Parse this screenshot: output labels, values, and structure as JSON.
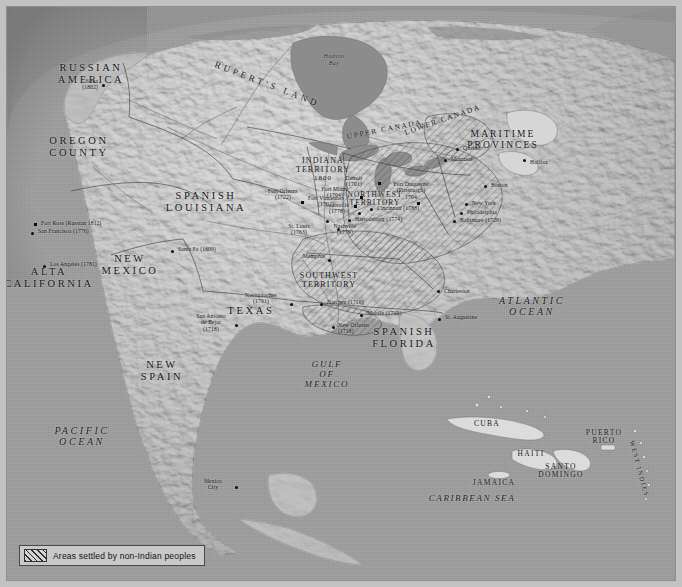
{
  "figure": {
    "kind": "historical-map",
    "title_visible": false
  },
  "colors": {
    "ocean": "#9c9c9c",
    "land": "#d8d8d8",
    "land_shadow": "#a9a9a9",
    "water_inland": "#8f8f8f",
    "text": "#161616",
    "frame": "#8e8e8e",
    "paper_margin": "#c2c2c2",
    "legend_bg": "#c9c9c9",
    "hatch": "#2e2e2e"
  },
  "legend": {
    "swatch_name": "diagonal-hatch-swatch",
    "label": "Areas settled by non-Indian peoples"
  },
  "oceans": [
    {
      "name": "pacific-ocean",
      "lines": [
        "PACIFIC",
        "OCEAN"
      ],
      "x": 42,
      "y": 424
    },
    {
      "name": "atlantic-ocean",
      "lines": [
        "ATLANTIC",
        "OCEAN"
      ],
      "x": 515,
      "y": 294
    },
    {
      "name": "gulf-of-mexico",
      "lines": [
        "GULF",
        "OF",
        "MEXICO"
      ],
      "x": 315,
      "y": 358
    },
    {
      "name": "caribbean-sea",
      "lines": [
        "CARIBBEAN SEA"
      ],
      "x": 463,
      "y": 491
    }
  ],
  "water_bodies": [
    {
      "name": "hudson-bay",
      "lines": [
        "Hudson",
        "Bay"
      ],
      "x": 325,
      "y": 52
    }
  ],
  "regions": [
    {
      "name": "russian-america",
      "lines": [
        "RUSSIAN",
        "AMERICA"
      ],
      "x": 81,
      "y": 61,
      "size": "big"
    },
    {
      "name": "oregon-county",
      "lines": [
        "OREGON",
        "COUNTY"
      ],
      "x": 68,
      "y": 134,
      "size": "big"
    },
    {
      "name": "alta-california",
      "lines": [
        "ALTA",
        "CALIFORNIA"
      ],
      "x": 22,
      "y": 265,
      "size": "big"
    },
    {
      "name": "new-mexico",
      "lines": [
        "NEW",
        "MEXICO"
      ],
      "x": 120,
      "y": 252,
      "size": "big"
    },
    {
      "name": "new-spain",
      "lines": [
        "NEW",
        "SPAIN"
      ],
      "x": 150,
      "y": 358,
      "size": "big"
    },
    {
      "name": "texas",
      "lines": [
        "TEXAS"
      ],
      "x": 243,
      "y": 304,
      "size": "big"
    },
    {
      "name": "spanish-louisiana",
      "lines": [
        "SPANISH",
        "LOUISIANA"
      ],
      "x": 196,
      "y": 189,
      "size": "big"
    },
    {
      "name": "spanish-florida",
      "lines": [
        "SPANISH",
        "FLORIDA"
      ],
      "x": 395,
      "y": 325,
      "size": "big"
    },
    {
      "name": "maritime-provinces",
      "lines": [
        "MARITIME",
        "PROVINCES"
      ],
      "x": 494,
      "y": 128,
      "size": "norm"
    },
    {
      "name": "ruperts-land",
      "lines": [
        "RUPERT'S LAND"
      ],
      "x": 228,
      "y": 62,
      "size": "arc"
    },
    {
      "name": "upper-canada",
      "lines": [
        "UPPER CANADA"
      ],
      "x": 355,
      "y": 129,
      "size": "arc"
    },
    {
      "name": "lower-canada",
      "lines": [
        "LOWER CANADA"
      ],
      "x": 414,
      "y": 121,
      "size": "arc"
    }
  ],
  "territories": [
    {
      "name": "indiana-territory",
      "lines": [
        "INDIANA",
        "TERRITORY",
        "1800"
      ],
      "x": 316,
      "y": 157
    },
    {
      "name": "northwest-territory",
      "lines": [
        "NORTHWEST",
        "TERRITORY"
      ],
      "x": 368,
      "y": 190
    },
    {
      "name": "southwest-territory",
      "lines": [
        "SOUTHWEST",
        "TERRITORY"
      ],
      "x": 320,
      "y": 271
    }
  ],
  "islands": [
    {
      "name": "cuba",
      "label": "CUBA",
      "x": 480,
      "y": 418
    },
    {
      "name": "haiti",
      "label": "HAITI",
      "x": 524,
      "y": 448
    },
    {
      "name": "santo-domingo",
      "lines": [
        "SANTO",
        "DOMINGO"
      ],
      "x": 553,
      "y": 461
    },
    {
      "name": "jamaica",
      "label": "JAMAICA",
      "x": 487,
      "y": 477
    },
    {
      "name": "puerto-rico",
      "lines": [
        "PUERTO",
        "RICO"
      ],
      "x": 596,
      "y": 428
    },
    {
      "name": "west-indies",
      "label": "WEST INDIES",
      "x": 637,
      "y": 445
    }
  ],
  "cities": [
    {
      "name": "sitka",
      "lines": [
        "Sitka",
        "(1802)"
      ],
      "x": 73,
      "y": 74,
      "dot": [
        95,
        77
      ],
      "align": "r",
      "marker": "dot"
    },
    {
      "name": "fort-ross",
      "lines": [
        "Fort Ross (Russian 1812)"
      ],
      "x": 34,
      "y": 216,
      "dot": [
        28,
        217
      ],
      "align": "l",
      "marker": "sq"
    },
    {
      "name": "san-francisco",
      "lines": [
        "San Francisco (1776)"
      ],
      "x": 30,
      "y": 224,
      "dot": [
        24,
        226
      ],
      "align": "l",
      "marker": "dot"
    },
    {
      "name": "los-angeles",
      "lines": [
        "Los Angeles (1781)"
      ],
      "x": 42,
      "y": 258,
      "dot": [
        36,
        259
      ],
      "align": "l",
      "marker": "dot"
    },
    {
      "name": "santa-fe",
      "lines": [
        "Santa Fe (1609)"
      ],
      "x": 170,
      "y": 243,
      "dot": [
        164,
        244
      ],
      "align": "l",
      "marker": "dot"
    },
    {
      "name": "san-antonio-de-bejar",
      "lines": [
        "San Antonio",
        "de Bejar",
        "(1718)"
      ],
      "x": 192,
      "y": 310,
      "dot": [
        228,
        318
      ],
      "align": "c",
      "marker": "dot"
    },
    {
      "name": "nacogdoches",
      "lines": [
        "Nacogdoches",
        "(1791)"
      ],
      "x": 241,
      "y": 288,
      "dot": [
        283,
        297
      ],
      "align": "c",
      "marker": "dot"
    },
    {
      "name": "new-orleans",
      "lines": [
        "New Orleans",
        "(1718)"
      ],
      "x": 330,
      "y": 319,
      "dot": [
        330,
        320
      ],
      "align": "l",
      "marker": "dot"
    },
    {
      "name": "natchez",
      "lines": [
        "Natchez (1716)"
      ],
      "x": 319,
      "y": 296,
      "dot": [
        314,
        297
      ],
      "align": "l",
      "marker": "dot"
    },
    {
      "name": "mobile",
      "lines": [
        "Mobile (1710)"
      ],
      "x": 359,
      "y": 307,
      "dot": [
        354,
        308
      ],
      "align": "l",
      "marker": "dot"
    },
    {
      "name": "st-augustine",
      "lines": [
        "St. Augustine"
      ],
      "x": 437,
      "y": 311,
      "dot": [
        432,
        312
      ],
      "align": "l",
      "marker": "dot"
    },
    {
      "name": "charleston",
      "lines": [
        "Charleston"
      ],
      "x": 436,
      "y": 286,
      "dot": [
        431,
        283
      ],
      "align": "l",
      "marker": "dot"
    },
    {
      "name": "memphis",
      "lines": [
        "Memphis"
      ],
      "x": 295,
      "y": 250,
      "dot": [
        322,
        253
      ],
      "align": "l",
      "marker": "dot"
    },
    {
      "name": "nashville",
      "lines": [
        "Nashville",
        "(1779)"
      ],
      "x": 336,
      "y": 222,
      "dot": [
        331,
        222
      ],
      "align": "l",
      "marker": "dot"
    },
    {
      "name": "harrodsburg",
      "lines": [
        "Harrodsburg (1774)"
      ],
      "x": 347,
      "y": 212,
      "dot": [
        342,
        213
      ],
      "align": "l",
      "marker": "dot"
    },
    {
      "name": "louisville",
      "lines": [
        "Louisville",
        "(1778)"
      ],
      "x": 330,
      "y": 199,
      "dot": [
        352,
        206
      ],
      "align": "c",
      "marker": "dot"
    },
    {
      "name": "cincinnati",
      "lines": [
        "Cincinnati (1788)"
      ],
      "x": 369,
      "y": 201,
      "dot": [
        364,
        202
      ],
      "align": "l",
      "marker": "dot"
    },
    {
      "name": "st-louis",
      "lines": [
        "St. Louis",
        "(1763)"
      ],
      "x": 290,
      "y": 220,
      "dot": [
        320,
        214
      ],
      "align": "c",
      "marker": "dot"
    },
    {
      "name": "fort-orleans",
      "lines": [
        "Fort Orleans",
        "(1722)"
      ],
      "x": 268,
      "y": 185,
      "dot": [
        295,
        195
      ],
      "align": "c",
      "marker": "sq"
    },
    {
      "name": "fort-vincennes",
      "lines": [
        "Fort Vincennes",
        "(1702)"
      ],
      "x": 306,
      "y": 192,
      "dot": [
        348,
        199
      ],
      "align": "c",
      "marker": "sq"
    },
    {
      "name": "fort-miami",
      "lines": [
        "Fort Miami",
        "(1704)"
      ],
      "x": 318,
      "y": 182,
      "dot": [
        354,
        190
      ],
      "align": "c",
      "marker": "sq"
    },
    {
      "name": "detroit",
      "lines": [
        "Detroit",
        "(1701)"
      ],
      "x": 332,
      "y": 172,
      "dot": [
        372,
        176
      ],
      "align": "c",
      "marker": "sq"
    },
    {
      "name": "fort-duquesne",
      "lines": [
        "Fort Duquesne",
        "(Pittsburgh)",
        "1704"
      ],
      "x": 403,
      "y": 176,
      "dot": [
        411,
        196
      ],
      "align": "c",
      "marker": "sq"
    },
    {
      "name": "baltimore",
      "lines": [
        "Baltimore (1729)"
      ],
      "x": 452,
      "y": 213,
      "dot": [
        447,
        214
      ],
      "align": "l",
      "marker": "dot"
    },
    {
      "name": "philadelphia",
      "lines": [
        "Philadelphia"
      ],
      "x": 459,
      "y": 205,
      "dot": [
        454,
        206
      ],
      "align": "l",
      "marker": "dot"
    },
    {
      "name": "new-york",
      "lines": [
        "New York"
      ],
      "x": 464,
      "y": 196,
      "dot": [
        459,
        197
      ],
      "align": "l",
      "marker": "dot"
    },
    {
      "name": "boston",
      "lines": [
        "Boston"
      ],
      "x": 483,
      "y": 178,
      "dot": [
        478,
        179
      ],
      "align": "l",
      "marker": "dot"
    },
    {
      "name": "halifax",
      "lines": [
        "Halifax"
      ],
      "x": 522,
      "y": 155,
      "dot": [
        517,
        153
      ],
      "align": "l",
      "marker": "dot"
    },
    {
      "name": "quebec",
      "lines": [
        "Quebec"
      ],
      "x": 455,
      "y": 141,
      "dot": [
        450,
        142
      ],
      "align": "l",
      "marker": "dot"
    },
    {
      "name": "montreal",
      "lines": [
        "Montreal"
      ],
      "x": 443,
      "y": 152,
      "dot": [
        438,
        153
      ],
      "align": "l",
      "marker": "dot"
    },
    {
      "name": "mexico-city",
      "lines": [
        "Mexico",
        "City"
      ],
      "x": 192,
      "y": 475,
      "dot": [
        229,
        480
      ],
      "align": "c",
      "marker": "dot"
    }
  ]
}
